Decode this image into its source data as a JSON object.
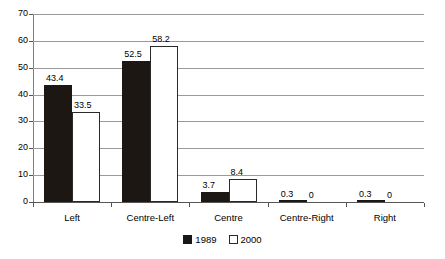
{
  "chart_data": {
    "type": "bar",
    "title": "",
    "subtitle": "",
    "xlabel": "",
    "ylabel": "",
    "ylim": [
      0,
      70
    ],
    "ytick_labels": [
      "0",
      "10",
      "20",
      "30",
      "40",
      "50",
      "60",
      "70"
    ],
    "ytick_values": [
      0,
      10,
      20,
      30,
      40,
      50,
      60,
      70
    ],
    "grid": true,
    "legend_position": "bottom-center",
    "categories": [
      "Left",
      "Centre-Left",
      "Centre",
      "Centre-Right",
      "Right"
    ],
    "series": [
      {
        "name": "1989",
        "color": "#1c1712",
        "values": [
          43.4,
          52.5,
          3.7,
          0.3,
          0.3
        ],
        "labels": [
          "43.4",
          "52.5",
          "3.7",
          "0.3",
          "0.3"
        ]
      },
      {
        "name": "2000",
        "color": "#ffffff",
        "values": [
          33.5,
          58.2,
          8.4,
          0,
          0
        ],
        "labels": [
          "33.5",
          "58.2",
          "8.4",
          "0",
          "0"
        ]
      }
    ]
  },
  "colors": {
    "series_1989": "#1c1712",
    "series_2000": "#ffffff",
    "gridline": "#9a9a9a",
    "axis": "#555555",
    "background": "#ffffff"
  }
}
